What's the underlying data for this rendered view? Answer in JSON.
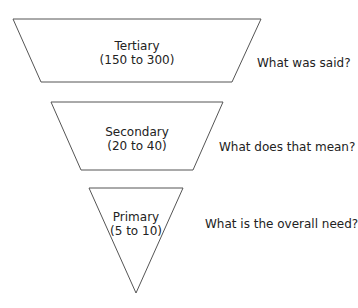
{
  "diagram": {
    "type": "inverted-funnel",
    "levels": [
      {
        "name": "Tertiary",
        "range": "(150 to 300)",
        "question": "What was said?"
      },
      {
        "name": "Secondary",
        "range": "(20 to 40)",
        "question": "What does that mean?"
      },
      {
        "name": "Primary",
        "range": "(5 to 10)",
        "question": "What is the overall need?"
      }
    ],
    "stroke_color": "#555555",
    "fill_color": "#ffffff"
  }
}
